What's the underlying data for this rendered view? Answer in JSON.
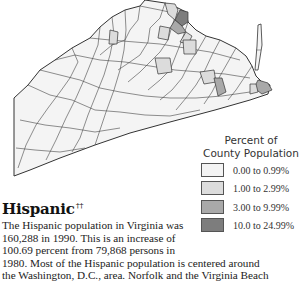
{
  "map": {
    "region": "Virginia",
    "colors": {
      "outline": "#333333",
      "class_0": "#f4f4f4",
      "class_1": "#dcdcdc",
      "class_2": "#a9a9a9",
      "class_3": "#7d7d7d"
    }
  },
  "legend": {
    "title_line1": "Percent of",
    "title_line2": "County Population",
    "items": [
      {
        "label": "0.00 to 0.99%",
        "color": "#f4f4f4"
      },
      {
        "label": "1.00 to 2.99%",
        "color": "#dcdcdc"
      },
      {
        "label": "3.00 to 9.99%",
        "color": "#a9a9a9"
      },
      {
        "label": "10.0 to 24.99%",
        "color": "#7d7d7d"
      }
    ]
  },
  "article": {
    "heading": "Hispanic",
    "heading_mark": "††",
    "lines": [
      "The Hispanic population in Virginia was",
      "160,288 in 1990. This is an increase of",
      "100.69 percent from 79,868 persons in",
      "1980. Most of the Hispanic population is centered around",
      "the Washington, D.C., area. Norfolk and the Virginia Beach"
    ]
  }
}
